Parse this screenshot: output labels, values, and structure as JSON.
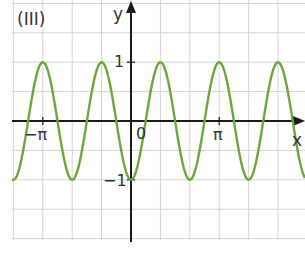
{
  "chart_data": {
    "type": "line",
    "title": "(III)",
    "xlabel": "x",
    "ylabel": "y",
    "function": "y = -cos(3x)",
    "series": [
      {
        "name": "y = -cos(3x)",
        "color": "#6aa83a"
      }
    ],
    "x_ticks": [
      {
        "value": -3.14159,
        "label": "−π"
      },
      {
        "value": 0,
        "label": "0"
      },
      {
        "value": 3.14159,
        "label": "π"
      }
    ],
    "y_ticks": [
      {
        "value": 1,
        "label": "1"
      },
      {
        "value": -1,
        "label": "−1"
      }
    ],
    "xlim": [
      -4.2,
      5.5
    ],
    "ylim": [
      -2.05,
      2.05
    ],
    "grid": true
  },
  "labels": {
    "title": "(III)",
    "x_axis": "x",
    "y_axis": "y",
    "origin": "0",
    "neg_pi": "−π",
    "pi": "π",
    "one": "1",
    "neg_one": "−1"
  },
  "colors": {
    "curve": "#6aa83a",
    "axis": "#1a1a1a",
    "grid": "#d4d4d4"
  }
}
